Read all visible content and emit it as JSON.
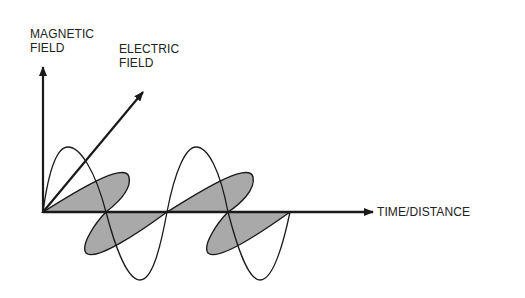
{
  "diagram": {
    "type": "electromagnetic-wave",
    "labels": {
      "magnetic_line1": "MAGNETIC",
      "magnetic_line2": "FIELD",
      "electric_line1": "ELECTRIC",
      "electric_line2": "FIELD",
      "axis": "TIME/DISTANCE"
    },
    "colors": {
      "stroke": "#1a1a1a",
      "fill": "#a9a9a9",
      "background": "#ffffff"
    },
    "geometry": {
      "origin": [
        43,
        212
      ],
      "vertical_arrow_tip": [
        43,
        66
      ],
      "diagonal_arrow_tip": [
        143,
        92
      ],
      "horizontal_arrow_tip": [
        373,
        212
      ],
      "cycles": 2,
      "wavelength_px": 124
    }
  }
}
